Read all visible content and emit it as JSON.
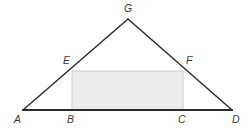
{
  "figure": {
    "type": "geometry-diagram",
    "canvas": {
      "width": 251,
      "height": 130,
      "background": "#ffffff"
    },
    "colors": {
      "stroke": "#2e2e2e",
      "baseline": "#2b2b2b",
      "rect_fill": "#ececec",
      "rect_stroke": "#cfcfcf",
      "label": "#3c3c3c"
    },
    "points": {
      "A": {
        "label": "A",
        "x": 23,
        "y": 110,
        "label_x": 14,
        "label_y": 123
      },
      "B": {
        "label": "B",
        "x": 72,
        "y": 110,
        "label_x": 67,
        "label_y": 123
      },
      "C": {
        "label": "C",
        "x": 183,
        "y": 110,
        "label_x": 178,
        "label_y": 123
      },
      "D": {
        "label": "D",
        "x": 232,
        "y": 110,
        "label_x": 232,
        "label_y": 123
      },
      "E": {
        "label": "E",
        "x": 72,
        "y": 71,
        "label_x": 63,
        "label_y": 64
      },
      "F": {
        "label": "F",
        "x": 183,
        "y": 71,
        "label_x": 186,
        "label_y": 64
      },
      "G": {
        "label": "G",
        "x": 128,
        "y": 19,
        "label_x": 124,
        "label_y": 12
      }
    },
    "segments": [
      {
        "name": "base-AD",
        "from": "A",
        "to": "D",
        "width": 2.1,
        "color": "#2b2b2b"
      },
      {
        "name": "left-side-AG",
        "from": "A",
        "to": "G",
        "width": 1.5,
        "color": "#2e2e2e"
      },
      {
        "name": "right-side-GD",
        "from": "G",
        "to": "D",
        "width": 1.5,
        "color": "#2e2e2e"
      }
    ],
    "rectangle": {
      "name": "rectangle-BEFC",
      "x": 72,
      "y": 71,
      "width": 111,
      "height": 39,
      "fill": "#ececec",
      "stroke": "#cfcfcf"
    }
  }
}
